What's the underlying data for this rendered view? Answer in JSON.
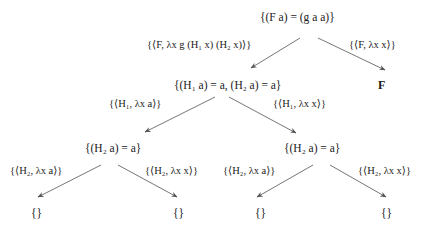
{
  "diagram": {
    "type": "tree",
    "nodes": {
      "root": "{(F a) = (g a a)}",
      "l1_left": "{(H₁ a) = a, (H₂ a) = a}",
      "l1_right": "F",
      "l2_left": "{(H₂ a) = a}",
      "l2_right": "{(H₂ a) = a}",
      "l3_ll": "{}",
      "l3_lr": "{}",
      "l3_rl": "{}",
      "l3_rr": "{}"
    },
    "edges": {
      "root_to_l1_left": "{⟨F, λx g (H₁ x) (H₂ x)⟩}",
      "root_to_l1_right": "{⟨F, λx x⟩}",
      "l1_left_to_l2_left": "{⟨H₁, λx a⟩}",
      "l1_left_to_l2_right": "{⟨H₁, λx x⟩}",
      "l2_left_to_l3_ll": "{⟨H₂, λx a⟩}",
      "l2_left_to_l3_lr": "{⟨H₂, λx x⟩}",
      "l2_right_to_l3_rl": "{⟨H₂, λx a⟩}",
      "l2_right_to_l3_rr": "{⟨H₂, λx x⟩}"
    },
    "colors": {
      "text": "#1a1a1a",
      "edge": "#555555",
      "background": "#ffffff"
    }
  }
}
